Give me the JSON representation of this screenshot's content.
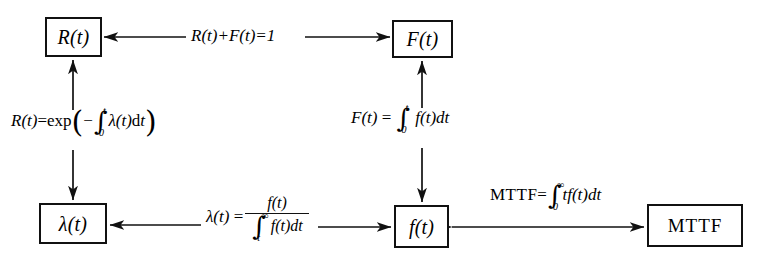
{
  "diagram": {
    "background": "#ffffff",
    "stroke": "#111111"
  },
  "nodes": [
    {
      "id": "reliability",
      "label": "R(t)",
      "style": "italic"
    },
    {
      "id": "unreliability",
      "label": "F(t)",
      "style": "italic"
    },
    {
      "id": "hazard-rate",
      "label": "λ(t)",
      "style": "italic"
    },
    {
      "id": "failure-density",
      "label": "f(t)",
      "style": "italic"
    },
    {
      "id": "mttf",
      "label": "MTTF",
      "style": "upright"
    }
  ],
  "edge_labels": {
    "r_plus_f": {
      "lhs": "R(t)+F(t)=1"
    },
    "r_exp": {
      "lhs": "R(t)",
      "eq": "=",
      "fn": "exp",
      "open": "(",
      "minus": "−",
      "integral_lower": "0",
      "integral_upper": "t",
      "integrand": "λ(t)",
      "differential": "d",
      "var": "t",
      "close": ")"
    },
    "f_integral": {
      "lhs": "F(t)",
      "eq": "=",
      "integral_lower": "0",
      "integral_upper": "t",
      "integrand": "f(t)",
      "differential": "dt"
    },
    "lambda_def": {
      "lhs": "λ(t)",
      "eq": "=",
      "numerator": "f(t)",
      "den_integral_lower": "t",
      "den_integral_upper": "∞",
      "den_integrand": "f(t)",
      "den_differential": "dt"
    },
    "mttf_def": {
      "lhs": "MTTF",
      "eq": "=",
      "integral_lower": "0",
      "integral_upper": "∞",
      "integrand": "tf(t)",
      "differential": "dt"
    }
  },
  "edges": [
    {
      "from": "reliability",
      "to": "unreliability",
      "direction": "both",
      "label": "r_plus_f"
    },
    {
      "from": "hazard-rate",
      "to": "reliability",
      "direction": "both",
      "label": "r_exp"
    },
    {
      "from": "failure-density",
      "to": "unreliability",
      "direction": "both",
      "label": "f_integral"
    },
    {
      "from": "failure-density",
      "to": "hazard-rate",
      "direction": "both",
      "label": "lambda_def"
    },
    {
      "from": "failure-density",
      "to": "mttf",
      "direction": "both",
      "label": "mttf_def"
    }
  ]
}
